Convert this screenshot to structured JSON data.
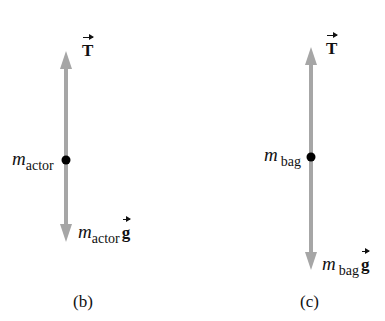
{
  "diagrams": [
    {
      "id": "b",
      "caption": "(b)",
      "body_label": {
        "m": "m",
        "sub": "actor"
      },
      "upward_force": {
        "symbol": "T"
      },
      "downward_force": {
        "m": "m",
        "sub": "actor",
        "symbol": "g"
      },
      "geometry": {
        "x": 66,
        "top": 51,
        "dot": 160,
        "bottom": 242
      }
    },
    {
      "id": "c",
      "caption": "(c)",
      "body_label": {
        "m": "m",
        "sub": "bag"
      },
      "upward_force": {
        "symbol": "T"
      },
      "downward_force": {
        "m": "m",
        "sub": "bag",
        "symbol": "g"
      },
      "geometry": {
        "x": 311,
        "top": 47,
        "dot": 157,
        "bottom": 270
      }
    }
  ],
  "colors": {
    "arrow": "#a6a6a6",
    "dot": "#000000",
    "text": "#111111"
  }
}
